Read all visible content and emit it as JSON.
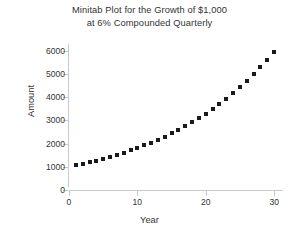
{
  "chart_data": {
    "type": "scatter",
    "title": "Minitab Plot for the Growth of $1,000 at 6% Compounded Quarterly",
    "title_line1": "Minitab Plot for the Growth of $1,000",
    "title_line2": "at 6% Compounded Quarterly",
    "xlabel": "Year",
    "ylabel": "Amount",
    "xlim": [
      0,
      31
    ],
    "ylim": [
      0,
      6300
    ],
    "xticks": [
      0,
      10,
      20,
      30
    ],
    "yticks": [
      0,
      1000,
      2000,
      3000,
      4000,
      5000,
      6000
    ],
    "xtick_labels": [
      "0",
      "10",
      "20",
      "30"
    ],
    "ytick_labels": [
      "0",
      "1000",
      "2000",
      "3000",
      "4000",
      "5000",
      "6000"
    ],
    "grid": false,
    "legend": false,
    "marker": "square",
    "marker_color": "#1a1a1a",
    "x": [
      1,
      2,
      3,
      4,
      5,
      6,
      7,
      8,
      9,
      10,
      11,
      12,
      13,
      14,
      15,
      16,
      17,
      18,
      19,
      20,
      21,
      22,
      23,
      24,
      25,
      26,
      27,
      28,
      29,
      30
    ],
    "values": [
      1061,
      1127,
      1196,
      1269,
      1347,
      1430,
      1517,
      1610,
      1709,
      1814,
      1925,
      2043,
      2168,
      2301,
      2443,
      2592,
      2751,
      2920,
      3099,
      3290,
      3491,
      3706,
      3933,
      4174,
      4430,
      4702,
      4991,
      5297,
      5622,
      5969
    ]
  }
}
